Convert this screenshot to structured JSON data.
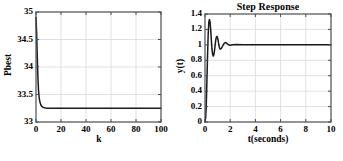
{
  "figure": {
    "background": "#ffffff",
    "axis_color": "#4d4d4d",
    "grid_color": "#d9d9d9",
    "line_color": "#1a1a1a"
  },
  "chart_data": [
    {
      "id": "pbest-convergence",
      "type": "line",
      "title": "",
      "xlabel": "k",
      "ylabel": "Pbest",
      "xlim": [
        0,
        100
      ],
      "ylim": [
        33,
        35
      ],
      "xticks": [
        "0",
        "20",
        "40",
        "60",
        "80",
        "100"
      ],
      "xtick_values": [
        0,
        20,
        40,
        60,
        80,
        100
      ],
      "yticks": [
        "33",
        "33.5",
        "34",
        "34.5",
        "35"
      ],
      "ytick_values": [
        33,
        33.5,
        34,
        34.5,
        35
      ],
      "grid": true,
      "legend": "none",
      "series": [
        {
          "name": "Pbest",
          "x": [
            0,
            0.5,
            1,
            1.5,
            2,
            2.5,
            3,
            3.5,
            4,
            4.5,
            5,
            5.5,
            6,
            7,
            8,
            9,
            10,
            12,
            15,
            20,
            25,
            30,
            40,
            50,
            60,
            70,
            80,
            90,
            100
          ],
          "values": [
            34.9,
            34.62,
            34.2,
            33.82,
            33.58,
            33.45,
            33.38,
            33.335,
            33.305,
            33.288,
            33.277,
            33.27,
            33.265,
            33.258,
            33.254,
            33.252,
            33.251,
            33.25,
            33.25,
            33.25,
            33.25,
            33.25,
            33.25,
            33.25,
            33.25,
            33.25,
            33.25,
            33.25,
            33.25
          ]
        }
      ]
    },
    {
      "id": "step-response",
      "type": "line",
      "title": "Step Response",
      "xlabel": "t(seconds)",
      "ylabel": "y(t)",
      "xlim": [
        0,
        10
      ],
      "ylim": [
        0,
        1.4
      ],
      "xticks": [
        "0",
        "2",
        "4",
        "6",
        "8",
        "10"
      ],
      "xtick_values": [
        0,
        2,
        4,
        6,
        8,
        10
      ],
      "yticks": [
        "0",
        "0.2",
        "0.4",
        "0.6",
        "0.8",
        "1",
        "1.2",
        "1.4"
      ],
      "ytick_values": [
        0,
        0.2,
        0.4,
        0.6,
        0.8,
        1,
        1.2,
        1.4
      ],
      "grid": true,
      "legend": "none",
      "series": [
        {
          "name": "y(t)",
          "x": [
            0,
            0.05,
            0.1,
            0.15,
            0.2,
            0.25,
            0.3,
            0.35,
            0.4,
            0.45,
            0.5,
            0.55,
            0.6,
            0.65,
            0.7,
            0.75,
            0.8,
            0.85,
            0.9,
            0.95,
            1.0,
            1.05,
            1.1,
            1.15,
            1.2,
            1.3,
            1.4,
            1.5,
            1.6,
            1.7,
            1.8,
            1.9,
            2.0,
            2.2,
            2.5,
            3.0,
            3.5,
            4.0,
            5.0,
            6.0,
            7.0,
            8.0,
            9.0,
            10.0
          ],
          "values": [
            0,
            0.05,
            0.22,
            0.52,
            0.85,
            1.12,
            1.29,
            1.33,
            1.3,
            1.2,
            1.07,
            0.95,
            0.88,
            0.855,
            0.87,
            0.92,
            0.99,
            1.06,
            1.1,
            1.11,
            1.09,
            1.05,
            1.0,
            0.96,
            0.945,
            0.955,
            0.985,
            1.015,
            1.03,
            1.025,
            1.01,
            0.998,
            0.995,
            1.0,
            1.004,
            1.0,
            1.0,
            1.0,
            1.0,
            1.0,
            1.0,
            1.0,
            1.0,
            1.0
          ]
        }
      ]
    }
  ]
}
